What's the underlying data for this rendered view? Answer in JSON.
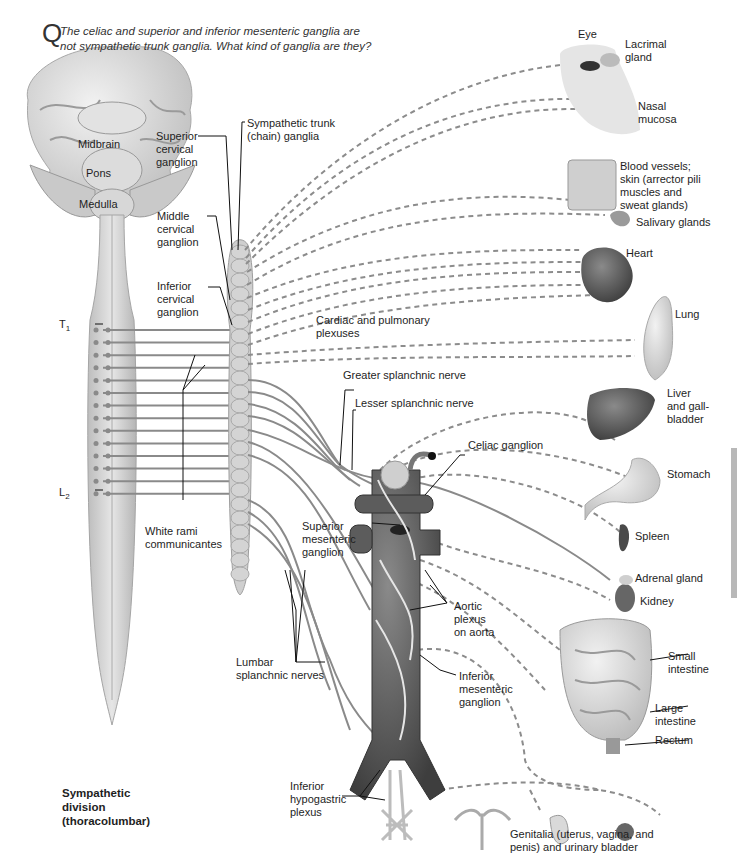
{
  "question": {
    "letter": "Q",
    "text": "The celiac and superior and inferior mesenteric ganglia are\nnot sympathetic trunk ganglia. What kind of ganglia are they?"
  },
  "brain_labels": {
    "midbrain": "Midbrain",
    "pons": "Pons",
    "medulla": "Medulla"
  },
  "spinal_labels": {
    "t1_letter": "T",
    "t1_sub": "1",
    "l2_letter": "L",
    "l2_sub": "2",
    "white_rami": "White rami\ncommunicantes"
  },
  "ganglia_labels": {
    "superior_cervical": "Superior\ncervical\nganglion",
    "middle_cervical": "Middle\ncervical\nganglion",
    "inferior_cervical": "Inferior\ncervical\nganglion",
    "sympathetic_trunk": "Sympathetic trunk\n(chain) ganglia",
    "cardiac_pulmonary": "Cardiac and pulmonary\nplexuses",
    "greater_splanchnic": "Greater splanchnic nerve",
    "lesser_splanchnic": "Lesser splanchnic nerve",
    "celiac": "Celiac ganglion",
    "superior_mesenteric": "Superior\nmesenteric\nganglion",
    "aortic_plexus": "Aortic\nplexus\non aorta",
    "inferior_mesenteric": "Inferior\nmesenteric\nganglion",
    "lumbar_splanchnic": "Lumbar\nsplanchnic nerves",
    "inferior_hypogastric": "Inferior\nhypogastric\nplexus"
  },
  "organ_labels": {
    "eye": "Eye",
    "lacrimal": "Lacrimal\ngland",
    "nasal": "Nasal\nmucosa",
    "skin": "Blood vessels;\nskin (arrector pili\nmuscles and\nsweat glands)",
    "salivary": "Salivary glands",
    "heart": "Heart",
    "lung": "Lung",
    "liver": "Liver\nand gall-\nbladder",
    "stomach": "Stomach",
    "spleen": "Spleen",
    "adrenal": "Adrenal gland",
    "kidney": "Kidney",
    "small_intestine": "Small\nintestine",
    "large_intestine": "Large\nintestine",
    "rectum": "Rectum",
    "genitalia": "Genitalia (uterus, vagina, and\npenis) and urinary bladder"
  },
  "division_title": "Sympathetic\ndivision\n(thoracolumbar)",
  "colors": {
    "nerve": "#8a8a8a",
    "dashed_nerve": "#8c8c8c",
    "tissue_light": "#d6d6d6",
    "tissue_dark": "#5a5a5a",
    "leader": "#111111"
  }
}
